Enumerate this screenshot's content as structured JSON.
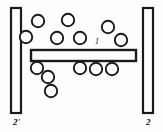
{
  "figure": {
    "type": "schematic-diagram",
    "canvas": {
      "width": 163,
      "height": 132
    },
    "background_color": "#ffffff",
    "line_color": "#1a1a1a"
  },
  "labels": {
    "plate_left": "2'",
    "plate_right": "2",
    "bar": "1"
  },
  "shapes": {
    "plate_left": {
      "x": 11,
      "y": 8,
      "width": 10,
      "height": 105
    },
    "plate_right": {
      "x": 143,
      "y": 8,
      "width": 10,
      "height": 105
    },
    "bar": {
      "x": 31,
      "y": 50,
      "width": 105,
      "height": 11
    }
  },
  "particles": {
    "radius": 6.2,
    "above": [
      {
        "cx": 38,
        "cy": 21
      },
      {
        "cx": 68,
        "cy": 20
      },
      {
        "cx": 26,
        "cy": 37
      },
      {
        "cx": 57,
        "cy": 38
      },
      {
        "cx": 80,
        "cy": 38
      },
      {
        "cx": 108,
        "cy": 27
      },
      {
        "cx": 121,
        "cy": 40
      }
    ],
    "below": [
      {
        "cx": 37,
        "cy": 68
      },
      {
        "cx": 48,
        "cy": 77
      },
      {
        "cx": 80,
        "cy": 68
      },
      {
        "cx": 96,
        "cy": 69
      },
      {
        "cx": 112,
        "cy": 69
      },
      {
        "cx": 51,
        "cy": 91
      }
    ]
  },
  "counts": {
    "particles_above": 7,
    "particles_below": 6,
    "particles_total": 13,
    "plates": 2,
    "bars": 1
  }
}
